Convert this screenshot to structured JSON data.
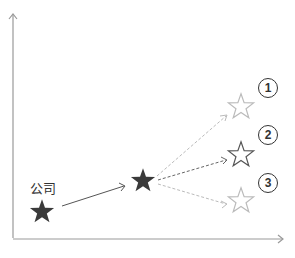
{
  "diagram": {
    "start_label": "公司",
    "options": [
      {
        "number": "1"
      },
      {
        "number": "2"
      },
      {
        "number": "3"
      }
    ],
    "colors": {
      "axis": "#999999",
      "filled_star": "#3a3a3a",
      "outline_star_highlight": "#555555",
      "outline_star_faded": "#bbbbbb",
      "dashed_highlight": "#666666",
      "dashed_faded": "#bbbbbb",
      "circle": "#333333"
    }
  }
}
